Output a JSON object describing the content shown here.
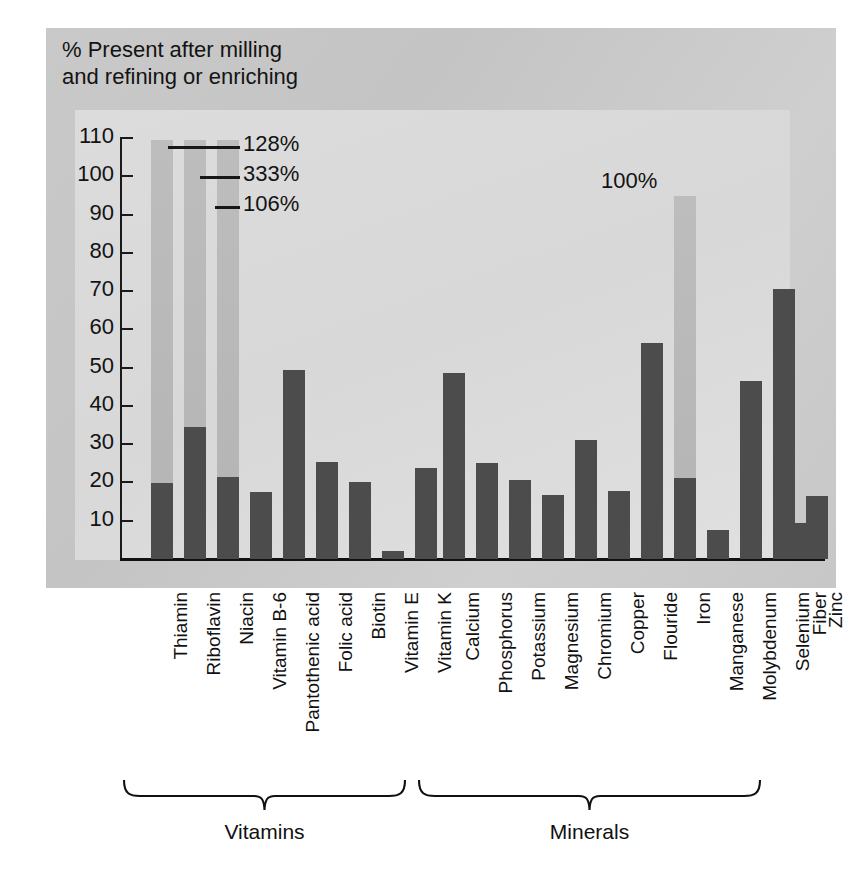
{
  "figure": {
    "title": "% Present after milling\nand refining or enriching",
    "background_plate_color": "#c8c8c8",
    "panel_color": "#dcdcdc",
    "bar_color": "#4c4c4c",
    "overflow_bar_color": "#bdbdbd"
  },
  "axis": {
    "y_ticks": [
      "110",
      "100",
      "90",
      "80",
      "70",
      "60",
      "50",
      "40",
      "30",
      "20",
      "10"
    ],
    "y_min": 0,
    "y_max": 110
  },
  "groups": [
    {
      "label": "Vitamins"
    },
    {
      "label": "Minerals"
    }
  ],
  "callouts": [
    {
      "label": "128%",
      "series": "Thiamin"
    },
    {
      "label": "333%",
      "series": "Riboflavin"
    },
    {
      "label": "106%",
      "series": "Niacin"
    },
    {
      "label": "100%",
      "series": "Iron"
    }
  ],
  "chart_data": {
    "type": "bar",
    "title": "% Present after milling and refining or enriching",
    "xlabel": "",
    "ylabel": "% Present after milling and refining or enriching",
    "ylim": [
      0,
      110
    ],
    "grid": false,
    "legend": "none",
    "categories": [
      "Thiamin",
      "Riboflavin",
      "Niacin",
      "Vitamin B-6",
      "Pantothenic acid",
      "Folic acid",
      "Biotin",
      "Vitamin E",
      "Vitamin K",
      "Calcium",
      "Phosphorus",
      "Potassium",
      "Magnesium",
      "Chromium",
      "Copper",
      "Flouride",
      "Iron",
      "Manganese",
      "Molybdenum",
      "Selenium",
      "Zinc",
      "Fiber"
    ],
    "values": [
      19.8,
      34.5,
      21.5,
      17.5,
      49.5,
      25.3,
      20.0,
      2.2,
      23.8,
      48.5,
      25.0,
      20.7,
      16.8,
      31.0,
      17.7,
      56.5,
      21.2,
      7.5,
      46.5,
      70.5,
      16.5,
      9.5
    ],
    "overflow_values": {
      "Thiamin": 128,
      "Riboflavin": 333,
      "Niacin": 106,
      "Iron": 100
    },
    "group_membership": {
      "Vitamins": [
        "Thiamin",
        "Riboflavin",
        "Niacin",
        "Vitamin B-6",
        "Pantothenic acid",
        "Folic acid",
        "Biotin",
        "Vitamin E",
        "Vitamin K"
      ],
      "Minerals": [
        "Calcium",
        "Phosphorus",
        "Potassium",
        "Magnesium",
        "Chromium",
        "Copper",
        "Flouride",
        "Iron",
        "Manganese",
        "Molybdenum",
        "Selenium",
        "Zinc"
      ],
      "Other": [
        "Fiber"
      ]
    }
  }
}
